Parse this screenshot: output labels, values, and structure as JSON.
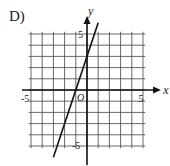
{
  "choice_label": "D)",
  "chart_data": {
    "type": "line",
    "title": "",
    "xlabel": "x",
    "ylabel": "y",
    "xlim": [
      -5,
      5
    ],
    "ylim": [
      -5,
      5
    ],
    "grid": true,
    "tick_labels": {
      "x": [
        "-5",
        "5"
      ],
      "y": [
        "5",
        "-5"
      ]
    },
    "origin_label": "O",
    "series": [
      {
        "name": "line",
        "equation": "y = 3x + 3",
        "x": [
          -3,
          -1,
          0,
          1
        ],
        "y": [
          -6,
          0,
          3,
          6
        ]
      }
    ]
  },
  "colors": {
    "grid": "#444444",
    "axis": "#111111",
    "line": "#111111"
  }
}
